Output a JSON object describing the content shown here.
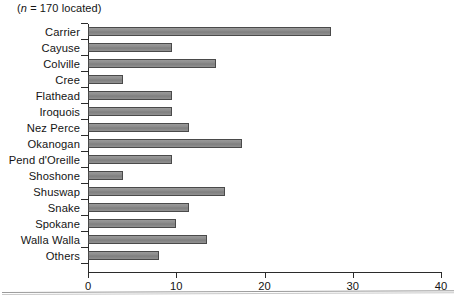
{
  "figure": {
    "note_prefix": "(",
    "note_italic": "n",
    "note_text": " = 170 located)",
    "note_full": "(n = 170 located)"
  },
  "chart_data": {
    "type": "bar",
    "orientation": "horizontal",
    "title": "",
    "subtitle": "(n = 170 located)",
    "xlabel": "",
    "ylabel": "",
    "xlim": [
      0,
      40
    ],
    "ylim": null,
    "grid": false,
    "legend": null,
    "xticks": [
      0,
      10,
      20,
      30,
      40
    ],
    "xtick_labels": [
      "0",
      "10",
      "20",
      "30",
      "40"
    ],
    "bar_color": "#8d8d8d",
    "bar_edge_color": "#4a4a4a",
    "axis_color": "#2b2b2b",
    "categories": [
      "Carrier",
      "Cayuse",
      "Colville",
      "Cree",
      "Flathead",
      "Iroquois",
      "Nez Perce",
      "Okanogan",
      "Pend d'Oreille",
      "Shoshone",
      "Shuswap",
      "Snake",
      "Spokane",
      "Walla Walla",
      "Others"
    ],
    "values": [
      27.5,
      9.5,
      14.5,
      4,
      9.5,
      9.5,
      11.5,
      17.5,
      9.5,
      4,
      15.5,
      11.5,
      10,
      13.5,
      8
    ]
  }
}
